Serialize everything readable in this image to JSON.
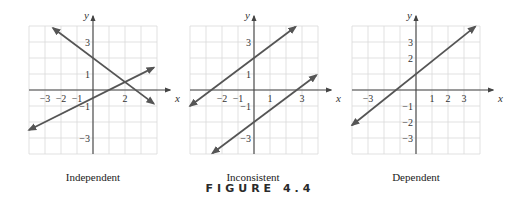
{
  "figure_title": "FIGURE 4.4",
  "colors": {
    "grid": "#d9d9d9",
    "axis": "#444444",
    "line": "#555555",
    "text": "#333333"
  },
  "chart_data": [
    {
      "type": "line",
      "title": "Independent",
      "xlabel": "x",
      "ylabel": "y",
      "xlim": [
        -4,
        4
      ],
      "ylim": [
        -4,
        4
      ],
      "grid": true,
      "x_tick_labels": [
        "−3",
        "−2",
        "−1",
        "2"
      ],
      "y_tick_labels": [
        "3",
        "1",
        "−1",
        "−3"
      ],
      "series": [
        {
          "name": "line 1",
          "slope": -0.75,
          "intercept": 2,
          "x_range": [
            -2.5,
            3.8
          ]
        },
        {
          "name": "line 2",
          "slope": 0.5,
          "intercept": -0.5,
          "x_range": [
            -4,
            3.8
          ]
        }
      ],
      "annotations": [
        "lines intersect at (2, 0.5)"
      ]
    },
    {
      "type": "line",
      "title": "Inconsistent",
      "xlabel": "x",
      "ylabel": "y",
      "xlim": [
        -4,
        4
      ],
      "ylim": [
        -4,
        4
      ],
      "grid": true,
      "x_tick_labels": [
        "−2",
        "−1",
        "1",
        "3"
      ],
      "y_tick_labels": [
        "3",
        "1",
        "−1",
        "−3"
      ],
      "series": [
        {
          "name": "line 1",
          "slope": 0.75,
          "intercept": 2,
          "x_range": [
            -4,
            2.6
          ]
        },
        {
          "name": "line 2",
          "slope": 0.75,
          "intercept": -2,
          "x_range": [
            -2.6,
            3.9
          ]
        }
      ],
      "annotations": [
        "parallel lines, no intersection"
      ]
    },
    {
      "type": "line",
      "title": "Dependent",
      "xlabel": "x",
      "ylabel": "y",
      "xlim": [
        -4,
        4
      ],
      "ylim": [
        -4,
        4
      ],
      "grid": true,
      "x_tick_labels": [
        "−3",
        "1",
        "2",
        "3"
      ],
      "y_tick_labels": [
        "3",
        "2",
        "−1",
        "−2",
        "−3"
      ],
      "series": [
        {
          "name": "coincident lines",
          "slope": 0.8,
          "intercept": 1,
          "x_range": [
            -4,
            3.7
          ]
        }
      ],
      "annotations": [
        "same line, infinitely many solutions"
      ]
    }
  ]
}
